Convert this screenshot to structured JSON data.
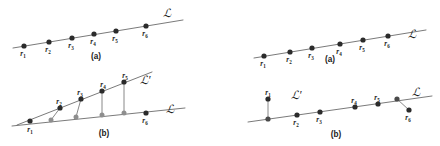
{
  "figure": {
    "caption_labels": {
      "a": "(a)",
      "b": "(b)"
    },
    "line_labels": {
      "L": "ℒ",
      "L_prime": "ℒ′"
    },
    "point_names": {
      "r1": "r",
      "r2": "r",
      "r3": "r",
      "r4": "r",
      "r5": "r",
      "r6": "r"
    },
    "point_subscripts": {
      "r1": "1",
      "r2": "2",
      "r3": "3",
      "r4": "4",
      "r5": "5",
      "r6": "6"
    },
    "colors": {
      "dark_dot": "#2b2b2b",
      "gray_dot": "#8e8e8e",
      "line": "#6b6b6b",
      "connector": "#7a7a7a",
      "text": "#1a1a1a",
      "background": "#ffffff"
    }
  },
  "panels": [
    {
      "id": "left-a",
      "caption": "(a)",
      "caption_pos": [
        96,
        59
      ],
      "lines": [
        {
          "name": "L",
          "x1": 13,
          "y1": 48,
          "x2": 183,
          "y2": 20
        }
      ],
      "line_label": {
        "text": "ℒ",
        "x": 163,
        "y": 17
      },
      "points": [
        {
          "id": "r1",
          "x": 24,
          "y": 46,
          "kind": "dark",
          "label_dx": -1,
          "label_dy": 10
        },
        {
          "id": "r2",
          "x": 49,
          "y": 42,
          "kind": "dark",
          "label_dx": -1,
          "label_dy": 10
        },
        {
          "id": "r3",
          "x": 72,
          "y": 38,
          "kind": "dark",
          "label_dx": -1,
          "label_dy": 10
        },
        {
          "id": "r4",
          "x": 94,
          "y": 34,
          "kind": "dark",
          "label_dx": -1,
          "label_dy": 10
        },
        {
          "id": "r5",
          "x": 116,
          "y": 31,
          "kind": "dark",
          "label_dx": -1,
          "label_dy": 10
        },
        {
          "id": "r6",
          "x": 146,
          "y": 26,
          "kind": "dark",
          "label_dx": -1,
          "label_dy": 10
        }
      ],
      "connectors": []
    },
    {
      "id": "left-b",
      "caption": "(b)",
      "caption_pos": [
        104,
        136
      ],
      "lines": [
        {
          "name": "L",
          "x1": 12,
          "y1": 126,
          "x2": 185,
          "y2": 108
        },
        {
          "name": "L_prime",
          "x1": 17,
          "y1": 125,
          "x2": 152,
          "y2": 72
        }
      ],
      "line_label": {
        "text": "ℒ",
        "x": 166,
        "y": 113
      },
      "line_label2": {
        "text": "ℒ′",
        "x": 140,
        "y": 84
      },
      "points": [
        {
          "id": "r1",
          "x": 30,
          "y": 121,
          "kind": "dark",
          "label_dx": 0,
          "label_dy": 11
        },
        {
          "id": "r2",
          "x": 60,
          "y": 108,
          "kind": "dark",
          "label_dx": -1,
          "label_dy": -4
        },
        {
          "id": "r3",
          "x": 81,
          "y": 99,
          "kind": "dark",
          "label_dx": -1,
          "label_dy": -4
        },
        {
          "id": "r4",
          "x": 102,
          "y": 91,
          "kind": "dark",
          "label_dx": 1,
          "label_dy": -4
        },
        {
          "id": "r5",
          "x": 124,
          "y": 82,
          "kind": "dark",
          "label_dx": 1,
          "label_dy": -4
        },
        {
          "id": "r6",
          "x": 146,
          "y": 113,
          "kind": "dark",
          "label_dx": -1,
          "label_dy": 10
        },
        {
          "id": "g1",
          "x": 51,
          "y": 120,
          "kind": "gray"
        },
        {
          "id": "g2",
          "x": 76,
          "y": 117,
          "kind": "gray"
        },
        {
          "id": "g3",
          "x": 102,
          "y": 115,
          "kind": "gray"
        },
        {
          "id": "g4",
          "x": 124,
          "y": 113,
          "kind": "gray"
        }
      ],
      "connectors": [
        {
          "x1": 60,
          "y1": 108,
          "x2": 51,
          "y2": 120
        },
        {
          "x1": 81,
          "y1": 99,
          "x2": 76,
          "y2": 117
        },
        {
          "x1": 102,
          "y1": 91,
          "x2": 102,
          "y2": 115
        },
        {
          "x1": 124,
          "y1": 82,
          "x2": 124,
          "y2": 113
        }
      ]
    },
    {
      "id": "right-a",
      "caption": "(a)",
      "caption_pos": [
        330,
        62
      ],
      "lines": [
        {
          "name": "L",
          "x1": 254,
          "y1": 58,
          "x2": 426,
          "y2": 30
        }
      ],
      "line_label": {
        "text": "ℒ",
        "x": 408,
        "y": 38
      },
      "points": [
        {
          "id": "r1",
          "x": 264,
          "y": 56,
          "kind": "dark",
          "label_dx": -1,
          "label_dy": 10
        },
        {
          "id": "r2",
          "x": 290,
          "y": 52,
          "kind": "dark",
          "label_dx": -1,
          "label_dy": 10
        },
        {
          "id": "r3",
          "x": 312,
          "y": 48,
          "kind": "dark",
          "label_dx": -1,
          "label_dy": 10
        },
        {
          "id": "r4",
          "x": 340,
          "y": 44,
          "kind": "dark",
          "label_dx": -1,
          "label_dy": 10
        },
        {
          "id": "r5",
          "x": 363,
          "y": 40,
          "kind": "dark",
          "label_dx": -1,
          "label_dy": 10
        },
        {
          "id": "r6",
          "x": 388,
          "y": 36,
          "kind": "dark",
          "label_dx": -1,
          "label_dy": 10
        }
      ],
      "connectors": []
    },
    {
      "id": "right-b",
      "caption": "(b)",
      "caption_pos": [
        336,
        137
      ],
      "lines": [
        {
          "name": "L",
          "x1": 248,
          "y1": 122,
          "x2": 432,
          "y2": 96
        }
      ],
      "line_label": {
        "text": "ℒ",
        "x": 412,
        "y": 96
      },
      "line_label2": {
        "text": "ℒ′",
        "x": 291,
        "y": 99
      },
      "points": [
        {
          "id": "r1",
          "x": 268,
          "y": 99,
          "kind": "dark",
          "label_dx": 0,
          "label_dy": -4
        },
        {
          "id": "r2",
          "x": 297,
          "y": 115,
          "kind": "dark",
          "label_dx": -1,
          "label_dy": 10
        },
        {
          "id": "r3",
          "x": 320,
          "y": 112,
          "kind": "dark",
          "label_dx": -1,
          "label_dy": 10
        },
        {
          "id": "r4",
          "x": 355,
          "y": 107,
          "kind": "dark",
          "label_dx": -1,
          "label_dy": -4
        },
        {
          "id": "r5",
          "x": 378,
          "y": 104,
          "kind": "dark",
          "label_dx": -1,
          "label_dy": -4
        },
        {
          "id": "r6",
          "x": 409,
          "y": 110,
          "kind": "dark",
          "label_dx": -1,
          "label_dy": 10
        },
        {
          "id": "g1",
          "x": 268,
          "y": 119,
          "kind": "gray-dark"
        },
        {
          "id": "g2",
          "x": 397,
          "y": 99,
          "kind": "gray-dark"
        }
      ],
      "connectors": [
        {
          "x1": 268,
          "y1": 99,
          "x2": 268,
          "y2": 119
        },
        {
          "x1": 397,
          "y1": 99,
          "x2": 409,
          "y2": 110
        }
      ]
    }
  ]
}
